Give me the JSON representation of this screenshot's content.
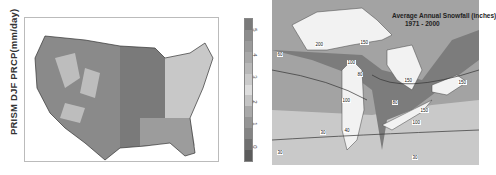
{
  "left_panel": {
    "ylabel": "PRISM DJF PRCP(mm/day)",
    "colorbar": {
      "ticks": [
        "5",
        "4",
        "3",
        "2",
        "1",
        "0"
      ],
      "colors": [
        "#7a7a7a",
        "#8c8c8c",
        "#9a9a9a",
        "#a8a8a8",
        "#b8b8b8",
        "#cacaca",
        "#dddddd",
        "#c4c4c4",
        "#a9a9a9",
        "#959595",
        "#848484",
        "#707070",
        "#5c5c5c"
      ]
    }
  },
  "right_panel": {
    "title": "Average Annual Snowfall (inches)",
    "subtitle": "1971 - 2000",
    "contour_labels": [
      "200",
      "150",
      "100",
      "80",
      "60",
      "40",
      "30",
      "100",
      "150",
      "150",
      "100",
      "150",
      "80",
      "30",
      "30"
    ]
  }
}
